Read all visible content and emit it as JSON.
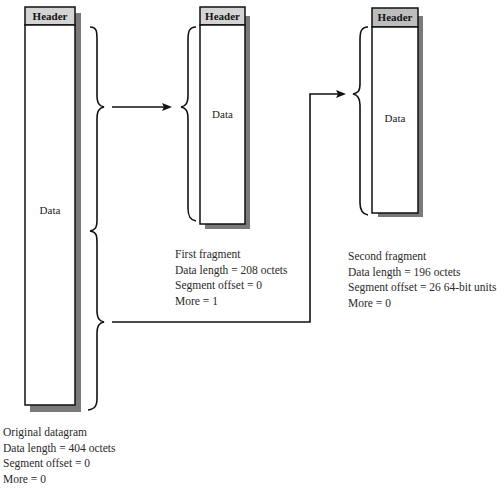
{
  "diagram": {
    "original": {
      "header": "Header",
      "body": "Data",
      "caption": [
        "Original datagram",
        "Data length = 404 octets",
        "Segment offset = 0",
        "More = 0"
      ]
    },
    "first_fragment": {
      "header": "Header",
      "body": "Data",
      "caption": [
        "First fragment",
        "Data length = 208 octets",
        "Segment offset = 0",
        "More = 1"
      ]
    },
    "second_fragment": {
      "header": "Header",
      "body": "Data",
      "caption": [
        "Second fragment",
        "Data length = 196 octets",
        "Segment offset = 26 64-bit units",
        "More = 0"
      ]
    },
    "colors": {
      "header_fill": "#d4d4d4",
      "shadow": "#7a7a7a",
      "line": "#111111"
    }
  }
}
